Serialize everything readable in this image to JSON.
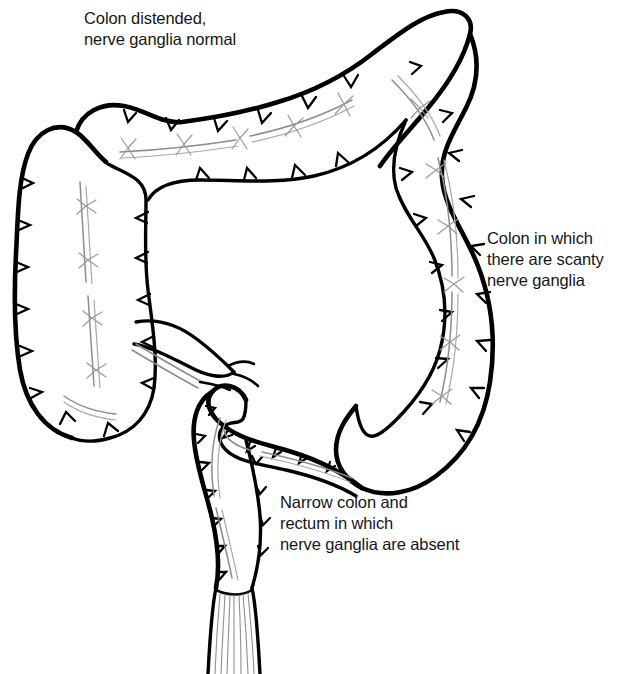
{
  "figure": {
    "background_color": "#ffffff",
    "line_color": "#000000",
    "text_color": "#161616",
    "style": "black-and-white medical line illustration"
  },
  "labels": {
    "proximal": "Colon distended,\nnerve ganglia normal",
    "scanty": "Colon in which\nthere are scanty\nnerve ganglia",
    "aganglionic": "Narrow colon and\nrectum in which\nnerve ganglia are absent"
  },
  "anatomy": {
    "parts": [
      "cecum",
      "ascending colon",
      "hepatic flexure",
      "transverse colon",
      "splenic flexure",
      "descending colon",
      "terminal ileum",
      "transition zone",
      "sigmoid colon",
      "rectum",
      "anal canal"
    ]
  }
}
